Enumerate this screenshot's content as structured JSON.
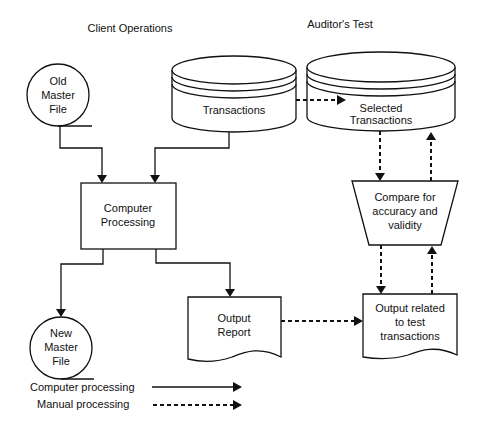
{
  "headers": {
    "client_operations": "Client Operations",
    "auditors_test": "Auditor's Test"
  },
  "nodes": {
    "old_master_file": [
      "Old",
      "Master",
      "File"
    ],
    "transactions": "Transactions",
    "selected_transactions": [
      "Selected",
      "Transactions"
    ],
    "computer_processing": [
      "Computer",
      "Processing"
    ],
    "compare": [
      "Compare for",
      "accuracy and",
      "validity"
    ],
    "new_master_file": [
      "New",
      "Master",
      "File"
    ],
    "output_report": [
      "Output",
      "Report"
    ],
    "output_related": [
      "Output related",
      "to test",
      "transactions"
    ]
  },
  "legend": {
    "computer_processing": "Computer processing",
    "manual_processing": "Manual processing"
  }
}
